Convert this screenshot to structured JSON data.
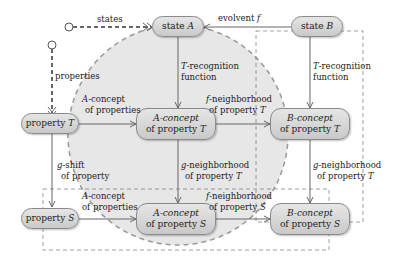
{
  "colors": {
    "node_fill_top": "#e6e6e6",
    "node_fill_bottom": "#c9c9c9",
    "node_border": "#8a8a8a",
    "arrow": "#666666",
    "circle_fill": "#d4d4d4",
    "dashed": "#888888"
  },
  "nodes": {
    "state_a": {
      "line1": "state",
      "var1": "A"
    },
    "state_b": {
      "line1": "state",
      "var1": "B"
    },
    "property_t": {
      "line1": "property",
      "var1": "T"
    },
    "property_s": {
      "line1": "property",
      "var1": "S"
    },
    "a_concept_t": {
      "var0": "A",
      "line1": "-concept",
      "line2": "of property",
      "var2": "T"
    },
    "b_concept_t": {
      "var0": "B",
      "line1": "-concept",
      "line2": "of property",
      "var2": "T"
    },
    "a_concept_s": {
      "var0": "A",
      "line1": "-concept",
      "line2": "of property",
      "var2": "S"
    },
    "b_concept_s": {
      "var0": "B",
      "line1": "-concept",
      "line2": "of property",
      "var2": "S"
    }
  },
  "edges": {
    "states": {
      "text": "states"
    },
    "properties": {
      "text": "properties"
    },
    "evolvent": {
      "text": "evolvent",
      "var": "f"
    },
    "t_recog_a": {
      "var": "T",
      "line1": "-recognition",
      "line2": "function"
    },
    "t_recog_b": {
      "var": "T",
      "line1": "-recognition",
      "line2": "function"
    },
    "a_concept_props_t": {
      "var": "A",
      "line1": "-concept",
      "line2": "of properties"
    },
    "a_concept_props_s": {
      "var": "A",
      "line1": "-concept",
      "line2": "of properties"
    },
    "f_neigh_t": {
      "var": "f",
      "line1": "-neighborhood",
      "line2": "of property",
      "var2": "T"
    },
    "f_neigh_s": {
      "var": "f",
      "line1": "-neighborhood",
      "line2": "of property",
      "var2": "S"
    },
    "g_shift": {
      "var": "g",
      "line1": "-shift",
      "line2": "of property"
    },
    "g_neigh_a": {
      "var": "g",
      "line1": "-neighborhood",
      "line2": "of property",
      "var2": "T"
    },
    "g_neigh_b": {
      "var": "g",
      "line1": "-neighborhood",
      "line2": "of property",
      "var2": "T"
    }
  }
}
